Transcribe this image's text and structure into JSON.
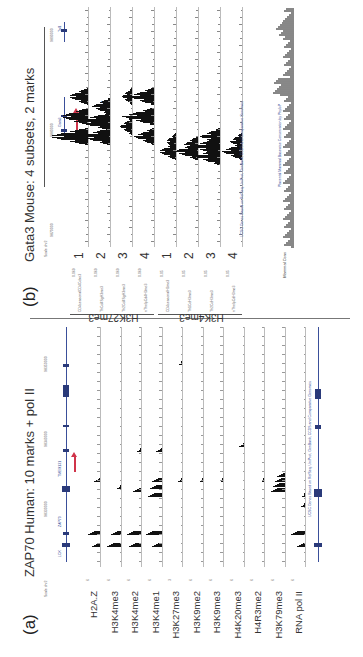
{
  "figure": {
    "orientation": "rotated-90-ccw",
    "panel_a": {
      "label": "(a)",
      "title": "ZAP70 Human: 10 marks + pol II",
      "scale_label": "Scale chr2",
      "coords": [
        "98330000",
        "98340000",
        "98350000"
      ],
      "gene_names": [
        "ZAP70",
        "TMEM131",
        "LCK"
      ],
      "arrow_color": "#d0344a",
      "tracks": [
        {
          "name": "H2A.Z",
          "scale": "6"
        },
        {
          "name": "H3K4me3",
          "scale": "6"
        },
        {
          "name": "H3K4me2",
          "scale": "6"
        },
        {
          "name": "H3K4me1",
          "scale": "6"
        },
        {
          "name": "H3K27me3",
          "scale": "3"
        },
        {
          "name": "H3K9me2",
          "scale": "6"
        },
        {
          "name": "H3K9me3",
          "scale": "6"
        },
        {
          "name": "H4K20me3",
          "scale": "6"
        },
        {
          "name": "H4R3me2",
          "scale": "6"
        },
        {
          "name": "H3K79me3",
          "scale": "6"
        },
        {
          "name": "RNA pol II",
          "scale": "6"
        }
      ],
      "bottom_annotation": "UCSC Genes Based on RefSeq, UniProt, GenBank, CCDS and Comparative Genomics"
    },
    "panel_b": {
      "label": "(b)",
      "title": "Gata3 Mouse: 4 subsets, 2 marks",
      "scale_label": "Scale chr2",
      "coords": [
        "9870000",
        "9880000",
        "9890000"
      ],
      "gene_names": [
        "Gata3",
        "Tal1"
      ],
      "arrow_red_color": "#d0344a",
      "arrow_blue_color": "#4a90d9",
      "groups": [
        {
          "mark": "H3K27me3",
          "subsets": [
            {
              "num": "1",
              "name": "CD4seasonalCD4Cdxe3",
              "scale": "0.069"
            },
            {
              "num": "2",
              "name": "ThCd4SgH3me3",
              "scale": "0.069"
            },
            {
              "num": "3",
              "name": "Th2Cd4SgH3me3",
              "scale": "0.069"
            },
            {
              "num": "4",
              "name": "nThelpCd4H3me3",
              "scale": "0.069"
            }
          ]
        },
        {
          "mark": "H3K4me3",
          "subsets": [
            {
              "num": "1",
              "name": "CD4seasonalH3me3",
              "scale": "0.05"
            },
            {
              "num": "2",
              "name": "Th1CdH3me3",
              "scale": "0.05"
            },
            {
              "num": "3",
              "name": "Th2CdH3me3",
              "scale": "0.05"
            },
            {
              "num": "4",
              "name": "nThelpCdH3me3",
              "scale": "0.05"
            }
          ]
        }
      ],
      "extra_tracks": [
        {
          "name": "Mammal Cons"
        }
      ],
      "bottom_annotation": "UCSC Genes Based on RefSeq, UniProt, GenBank, CCDS and Comparative Genomics",
      "conservation_label": "Placental Mammal Basewise Conservation by PhyloP"
    }
  }
}
